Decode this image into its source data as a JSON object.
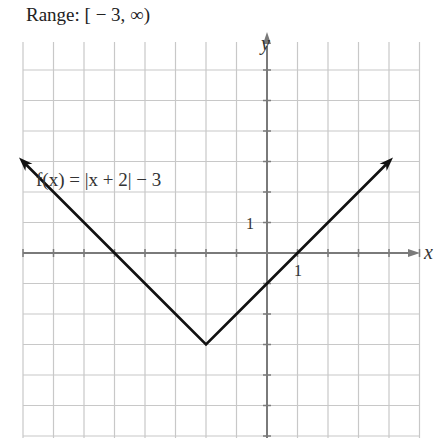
{
  "header": {
    "title": "Range: [ − 3, ∞)"
  },
  "chart_data": {
    "type": "line",
    "function_label": "f(x) = |x + 2| − 3",
    "xlabel": "x",
    "ylabel": "y",
    "tick_labels": {
      "x": "1",
      "y": "1"
    },
    "xlim": [
      -8,
      5
    ],
    "ylim": [
      -6,
      6
    ],
    "grid": true,
    "series": [
      {
        "name": "f(x) = |x + 2| − 3",
        "x": [
          -8,
          -7,
          -6,
          -5,
          -4,
          -3,
          -2,
          -1,
          0,
          1,
          2,
          3,
          4
        ],
        "y": [
          3,
          2,
          1,
          0,
          -1,
          -2,
          -3,
          -2,
          -1,
          0,
          1,
          2,
          3
        ]
      }
    ],
    "vertex": [
      -2,
      -3
    ],
    "x_intercepts": [
      -5,
      1
    ],
    "y_intercept": -1,
    "arrows": "both ends",
    "colors": {
      "line": "#111111",
      "grid": "#c8c8c8",
      "axes": "#7a7a7a"
    }
  }
}
